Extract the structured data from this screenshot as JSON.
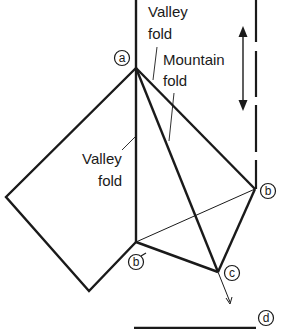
{
  "diagram": {
    "type": "origami-fold-diagram",
    "labels": {
      "valley_fold_top_line1": "Valley",
      "valley_fold_top_line2": "fold",
      "mountain_fold_line1": "Mountain",
      "mountain_fold_line2": "fold",
      "valley_fold_left_line1": "Valley",
      "valley_fold_left_line2": "fold"
    },
    "points": {
      "a": "a",
      "b": "b",
      "b_prime": "b",
      "c": "c",
      "d": "d"
    },
    "colors": {
      "line": "#1a1a1a",
      "background": "#ffffff"
    }
  }
}
